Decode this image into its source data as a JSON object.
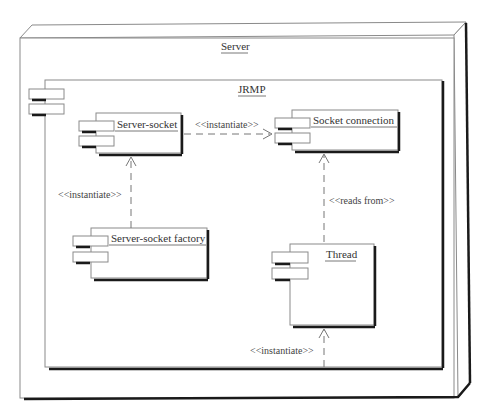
{
  "diagram": {
    "type": "UML deployment/component diagram",
    "node": {
      "title": "Server"
    },
    "package": {
      "title": "JRMP"
    },
    "components": [
      {
        "id": "server-socket",
        "label": "Server-socket"
      },
      {
        "id": "socket-connection",
        "label": "Socket connection"
      },
      {
        "id": "server-socket-factory",
        "label": "Server-socket factory"
      },
      {
        "id": "thread",
        "label": "Thread"
      }
    ],
    "dependencies": [
      {
        "from": "server-socket",
        "to": "socket-connection",
        "label": "<<instantiate>>"
      },
      {
        "from": "server-socket-factory",
        "to": "server-socket",
        "label": "<<instantiate>>"
      },
      {
        "from": "thread",
        "to": "socket-connection",
        "label": "<<reads from>>"
      },
      {
        "from": "external",
        "to": "thread",
        "label": "<<instantiate>>"
      }
    ]
  },
  "colors": {
    "line": "#8a8a8a",
    "shadow": "#1a1a1a",
    "background": "#ffffff"
  }
}
